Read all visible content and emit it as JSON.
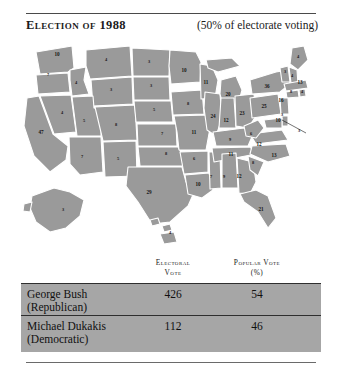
{
  "header": {
    "title": "Election of 1988",
    "note": "(50% of electorate voting)"
  },
  "map": {
    "name": "united-states-electoral-map-1988",
    "state_color": "#9a9a9a",
    "border_color": "#ffffff",
    "states": [
      {
        "abbr": "WA",
        "votes": "10",
        "x": 47,
        "y": 20
      },
      {
        "abbr": "OR",
        "votes": "7",
        "x": 38,
        "y": 40
      },
      {
        "abbr": "CA",
        "votes": "47",
        "x": 31,
        "y": 98
      },
      {
        "abbr": "NV",
        "votes": "4",
        "x": 52,
        "y": 78
      },
      {
        "abbr": "ID",
        "votes": "4",
        "x": 66,
        "y": 48
      },
      {
        "abbr": "MT",
        "votes": "4",
        "x": 96,
        "y": 25
      },
      {
        "abbr": "WY",
        "votes": "3",
        "x": 101,
        "y": 55
      },
      {
        "abbr": "UT",
        "votes": "5",
        "x": 74,
        "y": 86
      },
      {
        "abbr": "CO",
        "votes": "8",
        "x": 106,
        "y": 90
      },
      {
        "abbr": "AZ",
        "votes": "7",
        "x": 72,
        "y": 122
      },
      {
        "abbr": "NM",
        "votes": "5",
        "x": 108,
        "y": 124
      },
      {
        "abbr": "ND",
        "votes": "3",
        "x": 139,
        "y": 27
      },
      {
        "abbr": "SD",
        "votes": "3",
        "x": 141,
        "y": 51
      },
      {
        "abbr": "NE",
        "votes": "5",
        "x": 144,
        "y": 75
      },
      {
        "abbr": "KS",
        "votes": "7",
        "x": 152,
        "y": 99
      },
      {
        "abbr": "OK",
        "votes": "8",
        "x": 156,
        "y": 119
      },
      {
        "abbr": "TX",
        "votes": "29",
        "x": 139,
        "y": 158
      },
      {
        "abbr": "MN",
        "votes": "10",
        "x": 174,
        "y": 36
      },
      {
        "abbr": "IA",
        "votes": "8",
        "x": 178,
        "y": 69
      },
      {
        "abbr": "MO",
        "votes": "11",
        "x": 184,
        "y": 98
      },
      {
        "abbr": "AR",
        "votes": "6",
        "x": 184,
        "y": 124
      },
      {
        "abbr": "LA",
        "votes": "10",
        "x": 188,
        "y": 150
      },
      {
        "abbr": "WI",
        "votes": "11",
        "x": 196,
        "y": 48
      },
      {
        "abbr": "IL",
        "votes": "24",
        "x": 203,
        "y": 82
      },
      {
        "abbr": "MS",
        "votes": "7",
        "x": 201,
        "y": 142
      },
      {
        "abbr": "MI",
        "votes": "20",
        "x": 218,
        "y": 60
      },
      {
        "abbr": "IN",
        "votes": "12",
        "x": 216,
        "y": 86
      },
      {
        "abbr": "KY",
        "votes": "9",
        "x": 220,
        "y": 105
      },
      {
        "abbr": "TN",
        "votes": "11",
        "x": 221,
        "y": 120
      },
      {
        "abbr": "AL",
        "votes": "9",
        "x": 214,
        "y": 142
      },
      {
        "abbr": "OH",
        "votes": "23",
        "x": 232,
        "y": 79
      },
      {
        "abbr": "GA",
        "votes": "12",
        "x": 229,
        "y": 142
      },
      {
        "abbr": "FL",
        "votes": "21",
        "x": 251,
        "y": 175
      },
      {
        "abbr": "WV",
        "votes": "6",
        "x": 241,
        "y": 99
      },
      {
        "abbr": "SC",
        "votes": "8",
        "x": 243,
        "y": 128
      },
      {
        "abbr": "VA",
        "votes": "12",
        "x": 249,
        "y": 110
      },
      {
        "abbr": "NC",
        "votes": "13",
        "x": 264,
        "y": 121
      },
      {
        "abbr": "PA",
        "votes": "25",
        "x": 254,
        "y": 72
      },
      {
        "abbr": "NY",
        "votes": "36",
        "x": 257,
        "y": 52
      },
      {
        "abbr": "ME",
        "votes": "4",
        "x": 288,
        "y": 22
      },
      {
        "abbr": "VT",
        "votes": "3",
        "x": 275,
        "y": 37
      },
      {
        "abbr": "NH",
        "votes": "4",
        "x": 282,
        "y": 41
      },
      {
        "abbr": "MA",
        "votes": "13",
        "x": 290,
        "y": 48
      },
      {
        "abbr": "CT",
        "votes": "8",
        "x": 281,
        "y": 57
      },
      {
        "abbr": "RI",
        "votes": "4",
        "x": 292,
        "y": 57
      },
      {
        "abbr": "NJ",
        "votes": "16",
        "x": 271,
        "y": 66
      },
      {
        "abbr": "DE",
        "votes": "3",
        "x": 272,
        "y": 80
      },
      {
        "abbr": "MD",
        "votes": "10",
        "x": 268,
        "y": 86
      },
      {
        "abbr": "DC",
        "votes": "3",
        "x": 289,
        "y": 96
      },
      {
        "abbr": "AK",
        "votes": "3",
        "x": 53,
        "y": 175
      },
      {
        "abbr": "HI",
        "votes": "4",
        "x": 160,
        "y": 198
      }
    ]
  },
  "table": {
    "columns": {
      "candidate": "",
      "electoral": "Electoral Vote",
      "electoral_l1": "Electoral",
      "electoral_l2": "Vote",
      "popular_l1": "Popular Vote",
      "popular_l2": "(%)"
    },
    "rows": [
      {
        "name": "George Bush",
        "party": "(Republican)",
        "electoral": "426",
        "popular": "54"
      },
      {
        "name": "Michael Dukakis",
        "party": "(Democratic)",
        "electoral": "112",
        "popular": "46"
      }
    ],
    "band_color": "#a6a6a6"
  }
}
